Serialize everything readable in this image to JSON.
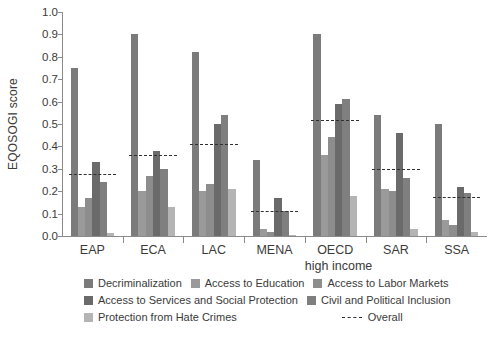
{
  "chart_data": {
    "type": "bar",
    "title": "",
    "xlabel": "",
    "ylabel": "EQOSOGI score",
    "ylim": [
      0.0,
      1.0
    ],
    "ytick_labels": [
      "1.0",
      "0.9",
      "0.8",
      "0.7",
      "0.6",
      "0.5",
      "0.4",
      "0.3",
      "0.2",
      "0.1",
      "0.0"
    ],
    "ytick_values": [
      1.0,
      0.9,
      0.8,
      0.7,
      0.6,
      0.5,
      0.4,
      0.3,
      0.2,
      0.1,
      0.0
    ],
    "grid": false,
    "legend_position": "bottom",
    "categories": [
      "EAP",
      "ECA",
      "LAC",
      "MENA",
      "OECD",
      "SAR",
      "SSA"
    ],
    "category_sublabels": [
      "",
      "",
      "",
      "",
      "high income",
      "",
      ""
    ],
    "series": [
      {
        "name": "Decriminalization",
        "color": "#7b7b7b",
        "values": [
          0.75,
          0.9,
          0.82,
          0.34,
          0.9,
          0.54,
          0.5
        ]
      },
      {
        "name": "Access to Education",
        "color": "#9a9a9a",
        "values": [
          0.13,
          0.2,
          0.2,
          0.03,
          0.36,
          0.21,
          0.07
        ]
      },
      {
        "name": "Access to Labor Markets",
        "color": "#8d8d8d",
        "values": [
          0.17,
          0.27,
          0.23,
          0.02,
          0.44,
          0.2,
          0.05
        ]
      },
      {
        "name": "Access to Services and Social Protection",
        "color": "#6a6a6a",
        "values": [
          0.33,
          0.38,
          0.5,
          0.17,
          0.59,
          0.46,
          0.22
        ]
      },
      {
        "name": "Civil and Political Inclusion",
        "color": "#7f7f7f",
        "values": [
          0.24,
          0.3,
          0.54,
          0.11,
          0.61,
          0.26,
          0.19
        ]
      },
      {
        "name": "Protection from Hate Crimes",
        "color": "#b4b4b4",
        "values": [
          0.015,
          0.13,
          0.21,
          0.005,
          0.18,
          0.03,
          0.02
        ]
      }
    ],
    "overall": {
      "name": "Overall",
      "style": "dashed",
      "color": "#2f2f2f",
      "values": [
        0.275,
        0.36,
        0.41,
        0.11,
        0.52,
        0.3,
        0.175
      ]
    }
  },
  "legend": {
    "items": [
      {
        "label": "Decriminalization"
      },
      {
        "label": "Access to Education"
      },
      {
        "label": "Access to Labor Markets"
      },
      {
        "label": "Access to Services and Social Protection"
      },
      {
        "label": "Civil and Political Inclusion"
      },
      {
        "label": "Protection from Hate Crimes"
      },
      {
        "label": "Overall"
      }
    ]
  }
}
